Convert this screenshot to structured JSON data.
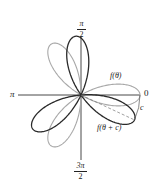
{
  "figure": {
    "labels": {
      "top_num": "π",
      "top_den": "2",
      "bottom_num": "3π",
      "bottom_den": "2",
      "left": "π",
      "right": "0",
      "curve1": "f(θ)",
      "curve2": "f(θ + c)",
      "angle": "c"
    },
    "colors": {
      "curve1": "#a8a8a8",
      "curve2": "#2a2a2a",
      "axes": "#333333"
    }
  },
  "chart_data": {
    "type": "polar",
    "title": "",
    "curves": [
      {
        "name": "f(θ)",
        "description": "three-petal rose",
        "petal_angles_deg": [
          0,
          120,
          240
        ],
        "color": "#a8a8a8"
      },
      {
        "name": "f(θ + c)",
        "description": "same rose rotated clockwise by c",
        "petal_angles_deg": [
          -25,
          95,
          215
        ],
        "color": "#2a2a2a"
      }
    ],
    "axis_labels": [
      "0",
      "π/2",
      "π",
      "3π/2"
    ],
    "annotations": [
      "c (arc between petal tips)",
      "dashed line from origin to rotated petal tip"
    ]
  }
}
